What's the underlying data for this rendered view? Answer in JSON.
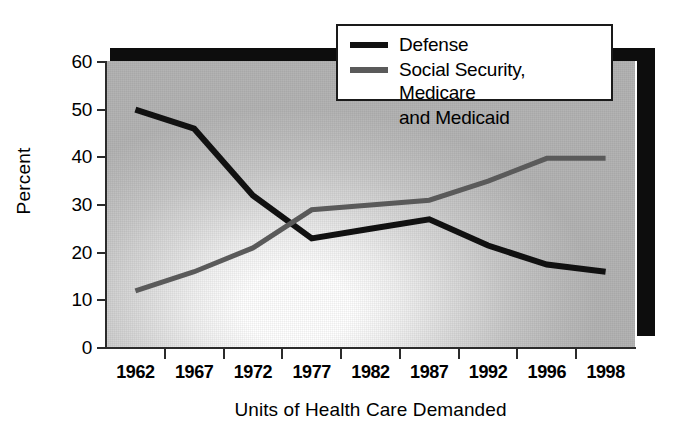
{
  "chart_data": {
    "type": "line",
    "title": "",
    "xlabel": "Units of Health Care Demanded",
    "ylabel": "Percent",
    "categories": [
      "1962",
      "1967",
      "1972",
      "1977",
      "1982",
      "1987",
      "1992",
      "1996",
      "1998"
    ],
    "ylim": [
      0,
      60
    ],
    "yticks": [
      0,
      10,
      20,
      30,
      40,
      50,
      60
    ],
    "ytick_labels": [
      "0",
      "10",
      "20",
      "30",
      "40",
      "50",
      "60"
    ],
    "grid": false,
    "legend_position": "top-right",
    "series": [
      {
        "name": "Defense",
        "color": "#111111",
        "values": [
          50,
          46,
          32,
          23,
          25,
          27,
          21.5,
          17.5,
          16
        ]
      },
      {
        "name": "Social Security, Medicare and Medicaid",
        "legend_line1": "Social Security, Medicare",
        "legend_line2": "and Medicaid",
        "color": "#5a5a5a",
        "values": [
          12,
          16,
          21,
          29,
          30,
          31,
          35,
          39.8,
          39.8
        ]
      }
    ]
  },
  "axes": {
    "y_title": "Percent",
    "x_title": "Units of Health Care Demanded"
  },
  "legend": {
    "items": [
      {
        "label": "Defense",
        "label2": ""
      },
      {
        "label": "Social Security, Medicare",
        "label2": "and Medicaid"
      }
    ]
  },
  "colors": {
    "defense": "#111111",
    "social": "#5a5a5a",
    "axis": "#2b2b2b",
    "shadow": "#0d0d0d",
    "plot_light": "#ffffff",
    "plot_dark": "#b4b4b4"
  }
}
